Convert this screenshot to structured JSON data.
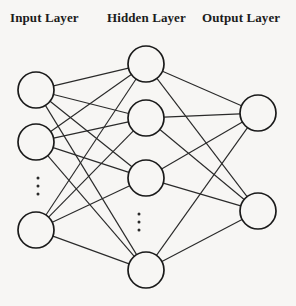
{
  "diagram": {
    "type": "neural-network",
    "title_visible": false,
    "background_color": "#f7f6f4",
    "node_stroke_color": "#1a1a1a",
    "node_fill_color": "#f7f6f4",
    "edge_color": "#2a2a2a",
    "labels": {
      "input": "Input Layer",
      "hidden": "Hidden Layer",
      "output": "Output Layer"
    },
    "layers": [
      {
        "id": "input",
        "label": "Input Layer",
        "node_count_drawn": 3,
        "has_ellipsis": true,
        "ellipsis_symbol": "⋮",
        "nodes": [
          {
            "id": "i1",
            "cx": 36,
            "cy": 90,
            "r": 18
          },
          {
            "id": "i2",
            "cx": 36,
            "cy": 142,
            "r": 18
          },
          {
            "id": "i3",
            "cx": 36,
            "cy": 230,
            "r": 18
          }
        ],
        "ellipsis": {
          "x": 38,
          "y": 186,
          "dots": 3
        }
      },
      {
        "id": "hidden",
        "label": "Hidden Layer",
        "node_count_drawn": 4,
        "has_ellipsis": true,
        "ellipsis_symbol": "⋮",
        "nodes": [
          {
            "id": "h1",
            "cx": 146,
            "cy": 64,
            "r": 18
          },
          {
            "id": "h2",
            "cx": 146,
            "cy": 118,
            "r": 18
          },
          {
            "id": "h3",
            "cx": 146,
            "cy": 178,
            "r": 18
          },
          {
            "id": "h4",
            "cx": 146,
            "cy": 270,
            "r": 18
          }
        ],
        "ellipsis": {
          "x": 139,
          "y": 222,
          "dots": 3
        }
      },
      {
        "id": "output",
        "label": "Output Layer",
        "node_count_drawn": 2,
        "has_ellipsis": false,
        "nodes": [
          {
            "id": "o1",
            "cx": 258,
            "cy": 113,
            "r": 18
          },
          {
            "id": "o2",
            "cx": 258,
            "cy": 211,
            "r": 18
          }
        ]
      }
    ],
    "connections": {
      "fully_connected": true,
      "input_to_hidden": [
        [
          "i1",
          "h1"
        ],
        [
          "i1",
          "h2"
        ],
        [
          "i1",
          "h3"
        ],
        [
          "i1",
          "h4"
        ],
        [
          "i2",
          "h1"
        ],
        [
          "i2",
          "h2"
        ],
        [
          "i2",
          "h3"
        ],
        [
          "i2",
          "h4"
        ],
        [
          "i3",
          "h1"
        ],
        [
          "i3",
          "h2"
        ],
        [
          "i3",
          "h3"
        ],
        [
          "i3",
          "h4"
        ]
      ],
      "hidden_to_output": [
        [
          "h1",
          "o1"
        ],
        [
          "h1",
          "o2"
        ],
        [
          "h2",
          "o1"
        ],
        [
          "h2",
          "o2"
        ],
        [
          "h3",
          "o1"
        ],
        [
          "h3",
          "o2"
        ],
        [
          "h4",
          "o1"
        ],
        [
          "h4",
          "o2"
        ]
      ]
    }
  }
}
